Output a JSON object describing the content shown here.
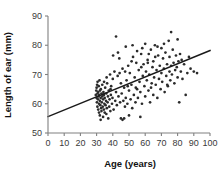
{
  "chart_data": {
    "type": "scatter",
    "title": "",
    "xlabel": "Age (years)",
    "ylabel": "Length of ear (mm)",
    "xlim": [
      0,
      100
    ],
    "ylim": [
      50,
      90
    ],
    "xticks": [
      0,
      10,
      20,
      30,
      40,
      50,
      60,
      70,
      80,
      90,
      100
    ],
    "yticks": [
      50,
      60,
      70,
      80,
      90
    ],
    "grid": false,
    "legend": null,
    "marker_color": "#2b2b2b",
    "line_color": "#1a1a1a",
    "axis_color": "#808080",
    "trendline": {
      "label": "linear fit",
      "x": [
        0,
        100
      ],
      "y": [
        55.6,
        78.2
      ]
    },
    "points": [
      [
        29.5,
        63.0
      ],
      [
        29.8,
        64.5
      ],
      [
        30.0,
        62.0
      ],
      [
        30.0,
        65.5
      ],
      [
        30.2,
        60.5
      ],
      [
        30.3,
        66.5
      ],
      [
        30.5,
        59.0
      ],
      [
        30.5,
        63.5
      ],
      [
        30.6,
        67.5
      ],
      [
        30.8,
        61.5
      ],
      [
        31.0,
        58.0
      ],
      [
        31.0,
        64.0
      ],
      [
        31.2,
        62.5
      ],
      [
        31.3,
        66.0
      ],
      [
        31.5,
        57.0
      ],
      [
        31.5,
        60.0
      ],
      [
        31.6,
        63.0
      ],
      [
        31.8,
        68.0
      ],
      [
        32.0,
        56.0
      ],
      [
        32.0,
        61.0
      ],
      [
        32.1,
        64.5
      ],
      [
        32.3,
        59.5
      ],
      [
        32.5,
        54.5
      ],
      [
        32.5,
        62.0
      ],
      [
        32.6,
        65.0
      ],
      [
        32.8,
        58.5
      ],
      [
        33.0,
        57.5
      ],
      [
        33.0,
        63.5
      ],
      [
        33.2,
        60.5
      ],
      [
        33.5,
        62.5
      ],
      [
        33.5,
        66.5
      ],
      [
        33.8,
        59.0
      ],
      [
        34.0,
        55.5
      ],
      [
        34.0,
        61.5
      ],
      [
        34.2,
        64.0
      ],
      [
        34.5,
        58.0
      ],
      [
        34.5,
        63.0
      ],
      [
        34.8,
        60.0
      ],
      [
        35.0,
        57.0
      ],
      [
        35.0,
        62.0
      ],
      [
        35.3,
        65.5
      ],
      [
        35.5,
        59.5
      ],
      [
        35.8,
        61.0
      ],
      [
        36.0,
        56.5
      ],
      [
        36.0,
        63.5
      ],
      [
        36.3,
        58.5
      ],
      [
        36.5,
        67.0
      ],
      [
        36.8,
        60.5
      ],
      [
        37.0,
        62.5
      ],
      [
        37.2,
        55.0
      ],
      [
        37.5,
        64.5
      ],
      [
        37.8,
        59.0
      ],
      [
        38.0,
        61.5
      ],
      [
        38.3,
        70.0
      ],
      [
        38.5,
        57.5
      ],
      [
        38.8,
        63.0
      ],
      [
        39.0,
        66.0
      ],
      [
        39.5,
        60.0
      ],
      [
        39.8,
        62.0
      ],
      [
        40.0,
        68.5
      ],
      [
        40.5,
        58.0
      ],
      [
        41.0,
        71.0
      ],
      [
        41.5,
        61.0
      ],
      [
        42.0,
        83.0
      ],
      [
        42.0,
        64.0
      ],
      [
        42.5,
        59.5
      ],
      [
        43.0,
        69.5
      ],
      [
        43.5,
        62.5
      ],
      [
        44.0,
        75.5
      ],
      [
        44.5,
        60.5
      ],
      [
        45.0,
        55.0
      ],
      [
        45.0,
        67.0
      ],
      [
        45.5,
        63.5
      ],
      [
        46.0,
        54.5
      ],
      [
        46.0,
        72.0
      ],
      [
        46.5,
        61.0
      ],
      [
        47.0,
        55.0
      ],
      [
        47.0,
        65.5
      ],
      [
        47.5,
        59.0
      ],
      [
        48.0,
        79.5
      ],
      [
        48.0,
        62.0
      ],
      [
        48.5,
        68.0
      ],
      [
        49.0,
        60.0
      ],
      [
        49.5,
        73.0
      ],
      [
        50.0,
        56.0
      ],
      [
        50.0,
        64.5
      ],
      [
        50.5,
        70.5
      ],
      [
        51.0,
        61.5
      ],
      [
        51.5,
        66.5
      ],
      [
        52.0,
        58.5
      ],
      [
        52.5,
        76.0
      ],
      [
        53.0,
        63.0
      ],
      [
        53.5,
        69.0
      ],
      [
        54.0,
        60.5
      ],
      [
        54.5,
        74.0
      ],
      [
        55.0,
        65.0
      ],
      [
        55.0,
        78.0
      ],
      [
        55.5,
        62.0
      ],
      [
        56.0,
        71.5
      ],
      [
        56.5,
        67.5
      ],
      [
        57.0,
        55.5
      ],
      [
        57.0,
        64.0
      ],
      [
        57.5,
        77.0
      ],
      [
        58.0,
        60.0
      ],
      [
        58.5,
        69.5
      ],
      [
        59.0,
        73.5
      ],
      [
        59.5,
        66.0
      ],
      [
        60.0,
        62.5
      ],
      [
        60.0,
        80.5
      ],
      [
        60.5,
        71.0
      ],
      [
        61.0,
        68.0
      ],
      [
        61.5,
        75.0
      ],
      [
        62.0,
        64.5
      ],
      [
        62.5,
        70.0
      ],
      [
        63.0,
        60.5
      ],
      [
        63.5,
        78.5
      ],
      [
        64.0,
        67.0
      ],
      [
        64.5,
        72.5
      ],
      [
        65.0,
        63.0
      ],
      [
        65.0,
        74.5
      ],
      [
        65.5,
        69.0
      ],
      [
        66.0,
        80.0
      ],
      [
        66.5,
        66.5
      ],
      [
        67.0,
        71.5
      ],
      [
        67.5,
        62.0
      ],
      [
        68.0,
        76.5
      ],
      [
        68.5,
        68.5
      ],
      [
        69.0,
        73.0
      ],
      [
        69.5,
        65.0
      ],
      [
        70.0,
        79.0
      ],
      [
        70.0,
        70.5
      ],
      [
        70.5,
        67.5
      ],
      [
        71.0,
        75.5
      ],
      [
        71.5,
        72.0
      ],
      [
        72.0,
        64.0
      ],
      [
        72.5,
        77.5
      ],
      [
        73.0,
        69.5
      ],
      [
        73.5,
        73.5
      ],
      [
        74.0,
        66.0
      ],
      [
        74.5,
        81.5
      ],
      [
        75.0,
        71.0
      ],
      [
        75.0,
        76.0
      ],
      [
        75.5,
        68.0
      ],
      [
        76.0,
        84.5
      ],
      [
        76.0,
        73.0
      ],
      [
        76.5,
        70.0
      ],
      [
        77.0,
        78.5
      ],
      [
        77.5,
        74.0
      ],
      [
        78.0,
        67.0
      ],
      [
        78.5,
        71.5
      ],
      [
        79.0,
        76.5
      ],
      [
        79.5,
        72.5
      ],
      [
        80.0,
        69.0
      ],
      [
        80.0,
        82.0
      ],
      [
        80.5,
        74.5
      ],
      [
        81.0,
        60.5
      ],
      [
        81.5,
        77.0
      ],
      [
        82.0,
        71.0
      ],
      [
        82.5,
        75.0
      ],
      [
        83.0,
        68.5
      ],
      [
        84.0,
        73.5
      ],
      [
        85.0,
        63.0
      ],
      [
        86.0,
        70.5
      ],
      [
        87.0,
        76.0
      ],
      [
        88.0,
        72.0
      ],
      [
        90.0,
        71.0
      ],
      [
        92.0,
        70.5
      ],
      [
        36.2,
        69.0
      ],
      [
        40.2,
        76.5
      ],
      [
        43.2,
        77.5
      ],
      [
        49.2,
        66.0
      ],
      [
        52.2,
        80.0
      ],
      [
        58.2,
        79.0
      ],
      [
        62.2,
        77.0
      ],
      [
        66.2,
        76.0
      ],
      [
        54.2,
        65.5
      ],
      [
        44.2,
        70.5
      ],
      [
        34.6,
        67.5
      ],
      [
        38.6,
        65.0
      ],
      [
        47.6,
        71.0
      ],
      [
        57.6,
        72.5
      ],
      [
        67.6,
        79.5
      ],
      [
        71.6,
        80.5
      ],
      [
        61.6,
        74.0
      ],
      [
        51.6,
        74.5
      ],
      [
        63.6,
        65.5
      ],
      [
        73.6,
        66.5
      ]
    ]
  }
}
